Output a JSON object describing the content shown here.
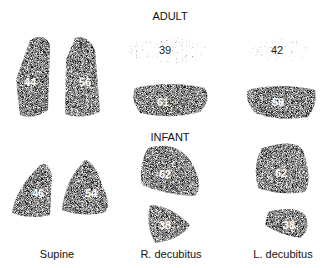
{
  "sections": {
    "adult": "ADULT",
    "infant": "INFANT"
  },
  "columns": [
    "Supine",
    "R. decubitus",
    "L. decubitus"
  ],
  "adult": {
    "supine": {
      "right": "44",
      "left": "56"
    },
    "r_decubitus": {
      "upper": "39",
      "lower": "61"
    },
    "l_decubitus": {
      "upper": "42",
      "lower": "58"
    }
  },
  "infant": {
    "supine": {
      "right": "46",
      "left": "54"
    },
    "r_decubitus": {
      "upper": "62",
      "lower": "38"
    },
    "l_decubitus": {
      "upper": "62",
      "lower": "38"
    }
  }
}
